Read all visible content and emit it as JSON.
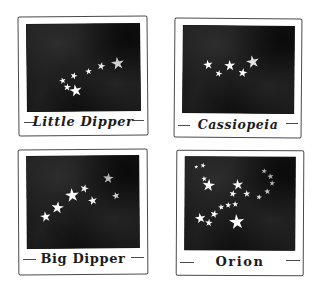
{
  "page": {
    "background_color": "#ffffff",
    "ink_color": "#1c1c1c",
    "sky_color": "#161616",
    "star_color": "#fdfdfb",
    "width": 315,
    "height": 291
  },
  "panels": [
    {
      "id": "little-dipper",
      "label": "Little Dipper",
      "label_style": "italic",
      "star_count": 7,
      "stars": [
        {
          "x": 80.5,
          "y": 45.5,
          "size": 13.5,
          "rot": -8
        },
        {
          "x": 66.0,
          "y": 48.0,
          "size": 8.5,
          "rot": 12
        },
        {
          "x": 54.0,
          "y": 54.5,
          "size": 7.0,
          "rot": -5
        },
        {
          "x": 41.5,
          "y": 60.0,
          "size": 7.5,
          "rot": 18
        },
        {
          "x": 31.5,
          "y": 65.5,
          "size": 7.0,
          "rot": -14
        },
        {
          "x": 35.5,
          "y": 72.5,
          "size": 8.0,
          "rot": 6
        },
        {
          "x": 42.5,
          "y": 76.0,
          "size": 13.0,
          "rot": -10
        }
      ]
    },
    {
      "id": "cassiopeia",
      "label": "Cassiopeia",
      "label_style": "italic",
      "star_count": 5,
      "stars": [
        {
          "x": 22.5,
          "y": 45.0,
          "size": 10.0,
          "rot": -10
        },
        {
          "x": 32.0,
          "y": 54.5,
          "size": 7.5,
          "rot": 14
        },
        {
          "x": 42.5,
          "y": 45.5,
          "size": 11.5,
          "rot": -4
        },
        {
          "x": 53.5,
          "y": 54.0,
          "size": 9.5,
          "rot": 9
        },
        {
          "x": 62.5,
          "y": 41.0,
          "size": 13.5,
          "rot": -12
        }
      ]
    },
    {
      "id": "big-dipper",
      "label": "Big Dipper",
      "label_style": "plain",
      "star_count": 7,
      "stars": [
        {
          "x": 16.5,
          "y": 66.0,
          "size": 11.0,
          "rot": -9
        },
        {
          "x": 27.0,
          "y": 55.5,
          "size": 13.0,
          "rot": 7
        },
        {
          "x": 40.0,
          "y": 42.5,
          "size": 14.5,
          "rot": -6
        },
        {
          "x": 51.5,
          "y": 35.5,
          "size": 9.0,
          "rot": 15
        },
        {
          "x": 58.5,
          "y": 48.5,
          "size": 9.5,
          "rot": -13
        },
        {
          "x": 72.5,
          "y": 24.0,
          "size": 11.0,
          "rot": 5
        },
        {
          "x": 79.5,
          "y": 43.5,
          "size": 8.0,
          "rot": -16
        }
      ]
    },
    {
      "id": "orion",
      "label": "Orion",
      "label_style": "plain",
      "star_count": 17,
      "stars": [
        {
          "x": 10.0,
          "y": 11.0,
          "size": 4.5,
          "rot": 0
        },
        {
          "x": 16.5,
          "y": 9.5,
          "size": 5.5,
          "rot": 10
        },
        {
          "x": 17.5,
          "y": 24.0,
          "size": 6.0,
          "rot": -8
        },
        {
          "x": 21.5,
          "y": 31.0,
          "size": 13.0,
          "rot": 6
        },
        {
          "x": 47.5,
          "y": 29.5,
          "size": 11.5,
          "rot": -7
        },
        {
          "x": 43.0,
          "y": 40.0,
          "size": 7.5,
          "rot": 12
        },
        {
          "x": 56.5,
          "y": 39.5,
          "size": 7.5,
          "rot": -5
        },
        {
          "x": 71.5,
          "y": 15.5,
          "size": 6.0,
          "rot": 8
        },
        {
          "x": 77.5,
          "y": 20.5,
          "size": 6.5,
          "rot": -10
        },
        {
          "x": 79.5,
          "y": 28.0,
          "size": 6.0,
          "rot": 4
        },
        {
          "x": 75.0,
          "y": 36.5,
          "size": 6.5,
          "rot": -6
        },
        {
          "x": 67.5,
          "y": 43.0,
          "size": 6.0,
          "rot": 11
        },
        {
          "x": 32.5,
          "y": 54.0,
          "size": 6.5,
          "rot": -9
        },
        {
          "x": 39.0,
          "y": 52.0,
          "size": 6.5,
          "rot": 7
        },
        {
          "x": 45.5,
          "y": 51.0,
          "size": 6.5,
          "rot": -4
        },
        {
          "x": 26.5,
          "y": 61.5,
          "size": 8.5,
          "rot": 14
        },
        {
          "x": 14.0,
          "y": 66.5,
          "size": 11.0,
          "rot": -11
        },
        {
          "x": 22.0,
          "y": 70.5,
          "size": 8.0,
          "rot": 5
        },
        {
          "x": 47.5,
          "y": 70.0,
          "size": 16.0,
          "rot": -6
        }
      ]
    }
  ]
}
